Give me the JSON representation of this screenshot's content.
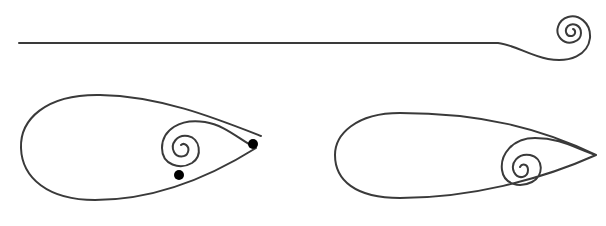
{
  "diagram": {
    "stroke_color": "#3a3a3a",
    "dot_color": "#000000",
    "stroke_width": 2,
    "figures": [
      {
        "id": "straight-line-with-spiral",
        "label": "",
        "description": "Long horizontal line ending in a curl/spiral at the right"
      },
      {
        "id": "open-teardrop-with-spiral",
        "label": "",
        "description": "Teardrop loop with open tip, inner spiral and two black marker dots",
        "markers": [
          {
            "x": 253,
            "y": 144
          },
          {
            "x": 179,
            "y": 175
          }
        ]
      },
      {
        "id": "closed-teardrop-with-spiral",
        "label": "",
        "description": "Teardrop loop with closed pointed tip and inner spiral near the tip"
      }
    ]
  }
}
